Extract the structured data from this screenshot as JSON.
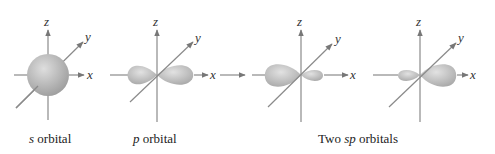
{
  "panels": [
    {
      "id": "s",
      "axis_labels": {
        "x": "x",
        "y": "y",
        "z": "z"
      },
      "caption_italic": "s",
      "caption_rest": " orbital"
    },
    {
      "id": "p",
      "axis_labels": {
        "x": "x",
        "y": "y",
        "z": "z"
      },
      "caption_italic": "p",
      "caption_rest": " orbital"
    },
    {
      "id": "sp1",
      "axis_labels": {
        "x": "x",
        "y": "y",
        "z": "z"
      }
    },
    {
      "id": "sp2",
      "axis_labels": {
        "x": "x",
        "y": "y",
        "z": "z"
      }
    }
  ],
  "sp_caption": {
    "pre": "Two ",
    "italic": "sp",
    "post": " orbitals"
  },
  "colors": {
    "axis": "#8a8a8a",
    "orbital_light": "#e6e6e6",
    "orbital_dark": "#9a9a9a",
    "text": "#222222"
  }
}
